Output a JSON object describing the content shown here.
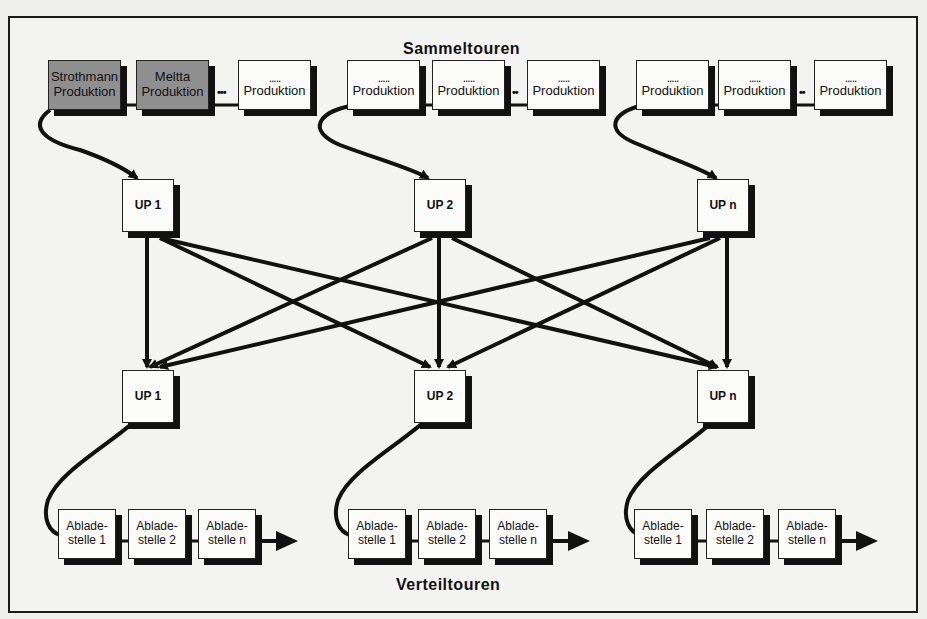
{
  "titles": {
    "top": "Sammeltouren",
    "bottom": "Verteiltouren"
  },
  "collection_groups": [
    {
      "boxes": [
        {
          "line1": "Strothmann",
          "line2": "Produktion",
          "fill": "gray"
        },
        {
          "line1": "Meltta",
          "line2": "Produktion",
          "fill": "gray"
        },
        {
          "line1": ".....",
          "line2": "Produktion",
          "fill": "white"
        }
      ],
      "connector": "•••"
    },
    {
      "boxes": [
        {
          "line1": ".....",
          "line2": "Produktion",
          "fill": "white"
        },
        {
          "line1": ".....",
          "line2": "Produktion",
          "fill": "white"
        },
        {
          "line1": ".....",
          "line2": "Produktion",
          "fill": "white"
        }
      ],
      "connector": "••"
    },
    {
      "boxes": [
        {
          "line1": ".....",
          "line2": "Produktion",
          "fill": "white"
        },
        {
          "line1": ".....",
          "line2": "Produktion",
          "fill": "white"
        },
        {
          "line1": ".....",
          "line2": "Produktion",
          "fill": "white"
        }
      ],
      "connector": "••"
    }
  ],
  "transshipment_top": [
    {
      "label": "UP 1"
    },
    {
      "label": "UP 2"
    },
    {
      "label": "UP n"
    }
  ],
  "transshipment_bottom": [
    {
      "label": "UP 1"
    },
    {
      "label": "UP 2"
    },
    {
      "label": "UP n"
    }
  ],
  "distribution_groups": [
    {
      "boxes": [
        {
          "line1": "Ablade-",
          "line2": "stelle 1"
        },
        {
          "line1": "Ablade-",
          "line2": "stelle 2"
        },
        {
          "line1": "Ablade-",
          "line2": "stelle n"
        }
      ]
    },
    {
      "boxes": [
        {
          "line1": "Ablade-",
          "line2": "stelle 1"
        },
        {
          "line1": "Ablade-",
          "line2": "stelle 2"
        },
        {
          "line1": "Ablade-",
          "line2": "stelle n"
        }
      ]
    },
    {
      "boxes": [
        {
          "line1": "Ablade-",
          "line2": "stelle 1"
        },
        {
          "line1": "Ablade-",
          "line2": "stelle 2"
        },
        {
          "line1": "Ablade-",
          "line2": "stelle n"
        }
      ]
    }
  ],
  "colors": {
    "line": "#111111",
    "highlight_box": "#8f8f8f",
    "box": "#fbfbfa"
  }
}
